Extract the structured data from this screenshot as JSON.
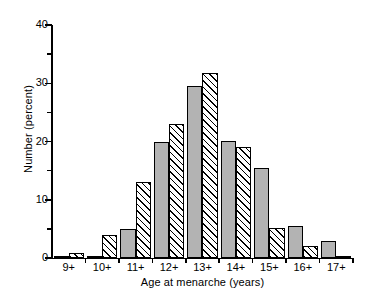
{
  "chart_data": {
    "type": "bar",
    "title": "",
    "subtitle": "",
    "xlabel": "Age at menarche (years)",
    "ylabel": "Number (percent)",
    "categories": [
      "9+",
      "10+",
      "11+",
      "12+",
      "13+",
      "14+",
      "15+",
      "16+",
      "17+"
    ],
    "series": [
      {
        "name": "solid",
        "style": "solid-grey",
        "color": "#b3b3b3",
        "values": [
          0.4,
          0.4,
          5.0,
          20.0,
          29.5,
          20.1,
          15.5,
          5.5,
          3.0
        ]
      },
      {
        "name": "hatched",
        "style": "diagonal-hatch",
        "color": "#ffffff",
        "values": [
          0.8,
          4.0,
          13.0,
          23.0,
          31.8,
          19.0,
          5.1,
          2.1,
          0.3
        ]
      }
    ],
    "ylim": [
      0,
      40
    ],
    "xlim_categories": 9,
    "ytick_major": [
      0,
      10,
      20,
      30,
      40
    ],
    "ytick_minor": [
      5,
      15,
      25,
      35
    ],
    "ytick_labels": [
      "0",
      "10",
      "20",
      "30",
      "40"
    ],
    "grid": false,
    "legend": null,
    "legend_position": "none",
    "annotations": []
  }
}
